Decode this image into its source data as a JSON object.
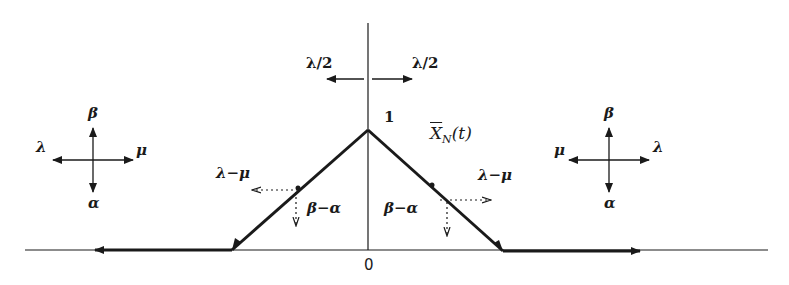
{
  "diagram": {
    "colors": {
      "ink": "#1a1a1a",
      "background": "#ffffff"
    },
    "axis": {
      "origin_label": "0",
      "peak_label": "1"
    },
    "top_rates": {
      "left": "λ/2",
      "right": "λ/2"
    },
    "curve_label": {
      "main": "X",
      "subscript": "N",
      "arg": "(t)"
    },
    "left_slope": {
      "horizontal_rate": "λ−μ",
      "vertical_rate": "β−α"
    },
    "right_slope": {
      "horizontal_rate": "λ−μ",
      "vertical_rate": "β−α"
    },
    "left_compass": {
      "up": "β",
      "down": "α",
      "left": "λ",
      "right": "μ"
    },
    "right_compass": {
      "up": "β",
      "down": "α",
      "left": "μ",
      "right": "λ"
    }
  }
}
